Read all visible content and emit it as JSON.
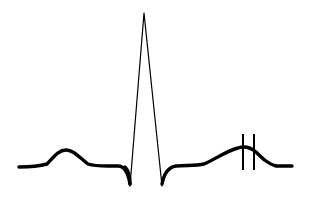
{
  "diagram": {
    "type": "ecg-waveform",
    "components": [
      "baseline",
      "P wave",
      "Q wave",
      "R wave",
      "S wave",
      "ST segment",
      "T wave"
    ],
    "markers": {
      "count": 2,
      "location": "T wave peak",
      "style": "vertical lines"
    },
    "colors": {
      "trace": "#000000",
      "background": "#ffffff"
    }
  }
}
